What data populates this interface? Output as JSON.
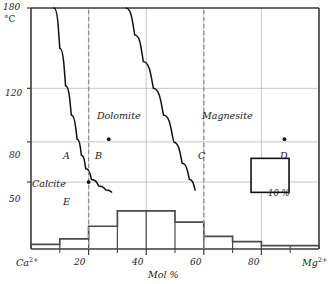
{
  "chart_data": {
    "type": "bar",
    "title": "",
    "xlabel": "Mol %",
    "ylabel": "°C",
    "xlim": [
      0,
      100
    ],
    "ylim": [
      0,
      180
    ],
    "grid": true,
    "x_axis_end_labels": {
      "left": "Ca",
      "left_sup": "2+",
      "right": "Mg",
      "right_sup": "2+"
    },
    "x_ticks_major": [
      20,
      40,
      60,
      80
    ],
    "x_ticks_minor": [
      10,
      30,
      50,
      70,
      90
    ],
    "y_ticks": [
      50,
      80,
      120,
      180
    ],
    "categories": [
      "0-10",
      "10-20",
      "20-30",
      "30-40",
      "40-50",
      "50-60",
      "60-70",
      "70-80",
      "80-90",
      "90-100"
    ],
    "values": [
      3.5,
      7.5,
      17,
      28.5,
      28.5,
      20,
      9.5,
      5.5,
      2.5,
      2.5
    ],
    "values_unit": "%",
    "series": [
      {
        "name": "frequency histogram",
        "values": [
          3.5,
          7.5,
          17,
          28.5,
          28.5,
          20,
          9.5,
          5.5,
          2.5,
          2.5
        ]
      }
    ],
    "curves": [
      {
        "name": "calcite-dolomite solvus limb",
        "points": [
          [
            8,
            180
          ],
          [
            10,
            150
          ],
          [
            12,
            122
          ],
          [
            14,
            100
          ],
          [
            16,
            82
          ],
          [
            17.5,
            70
          ],
          [
            19,
            60
          ],
          [
            21,
            52
          ],
          [
            23.5,
            47
          ],
          [
            26,
            44
          ],
          [
            28,
            42.5
          ]
        ]
      },
      {
        "name": "dolomite-magnesite solvus limb",
        "points": [
          [
            33,
            180
          ],
          [
            36,
            160
          ],
          [
            39,
            140
          ],
          [
            42.5,
            120
          ],
          [
            46,
            100
          ],
          [
            49.5,
            80
          ],
          [
            52.5,
            64
          ],
          [
            55,
            52
          ],
          [
            57,
            44
          ]
        ]
      }
    ],
    "annotations": [
      {
        "label": "A",
        "x": 20,
        "y": 82,
        "marker": false
      },
      {
        "label": "B",
        "x": 27,
        "y": 82,
        "marker": true
      },
      {
        "label": "C",
        "x": 60,
        "y": 82,
        "marker": false
      },
      {
        "label": "D",
        "x": 88,
        "y": 82,
        "marker": true
      },
      {
        "label": "E",
        "x": 20,
        "y": 50,
        "marker": true
      }
    ],
    "field_labels": [
      {
        "label": "Calcite",
        "x": 10,
        "y": 63
      },
      {
        "label": "Dolomite",
        "x": 36,
        "y": 108
      },
      {
        "label": "Magnesite",
        "x": 70,
        "y": 108
      }
    ],
    "reference_lines": [
      {
        "orientation": "vertical",
        "x": 20,
        "style": "dashed"
      },
      {
        "orientation": "vertical",
        "x": 60,
        "style": "dashed"
      }
    ],
    "legend": {
      "box_label": "10 %",
      "x": 83,
      "y": 55,
      "position": "inside-right"
    }
  },
  "colors": {
    "axis": "#3a3a3a",
    "grid": "#b9b9b9",
    "curve": "#111111",
    "bar": "#4a4a4a",
    "dashed": "#8e8e8e",
    "text": "#1a1a1a",
    "background": "#ffffff"
  }
}
